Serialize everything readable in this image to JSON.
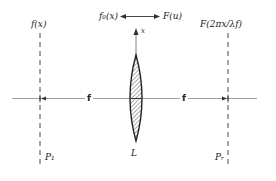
{
  "diagram": {
    "title_relation": {
      "left": "f₀(x)",
      "right": "F(u)",
      "arrow": "double-arrow"
    },
    "axis_label_x": "x",
    "left_plane_function": "f(x)",
    "right_plane_function": "F(2πx/λf)",
    "focal_left": "f",
    "focal_right": "f",
    "lens_label": "L",
    "left_plane_label": "P₁",
    "right_plane_label": "Pᵣ",
    "colors": {
      "ink": "#222222",
      "axis": "#888888",
      "hatch": "#555555"
    }
  }
}
